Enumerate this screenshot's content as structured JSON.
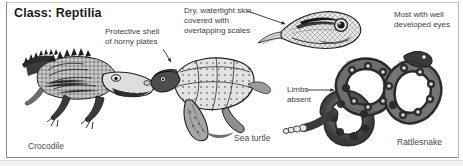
{
  "figure": {
    "title": "Class: Reptilia",
    "annotations": [
      {
        "id": "protective-shell",
        "text": "Protective shell\nof horny plates"
      },
      {
        "id": "dry-skin",
        "text": "Dry, watertight skin\ncovered with\noverlapping scales"
      },
      {
        "id": "developed-eyes",
        "text": "Most with well\ndeveloped eyes"
      },
      {
        "id": "limbs-absent",
        "text": "Limbs\nabsent"
      }
    ],
    "captions": [
      {
        "id": "crocodile",
        "text": "Crocodile"
      },
      {
        "id": "sea-turtle",
        "text": "Sea turtle"
      },
      {
        "id": "rattlesnake",
        "text": "Rattlesnake"
      }
    ],
    "illustrations": [
      {
        "id": "crocodile-illustration",
        "label": "crocodile"
      },
      {
        "id": "sea-turtle-illustration",
        "label": "sea turtle"
      },
      {
        "id": "snake-head-illustration",
        "label": "snake head"
      },
      {
        "id": "rattlesnake-illustration",
        "label": "coiled rattlesnake"
      }
    ],
    "colors": {
      "ink": "#1b1b1b",
      "annotation_text": "#3d3d3d",
      "caption_text": "#4a4a4a",
      "frame": "#8b8b8b",
      "background": "#ffffff"
    }
  }
}
